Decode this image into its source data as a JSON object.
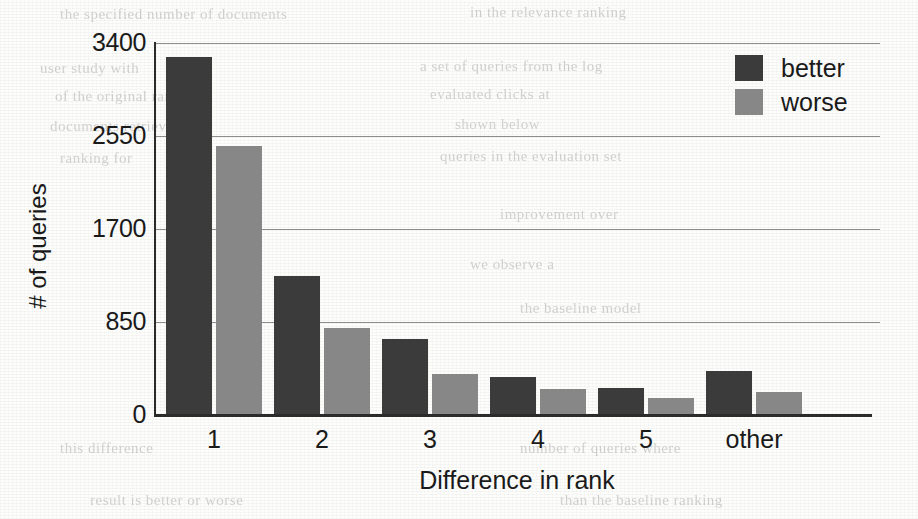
{
  "chart_data": {
    "type": "bar",
    "title": "",
    "xlabel": "Difference in rank",
    "ylabel": "# of queries",
    "categories": [
      "1",
      "2",
      "3",
      "4",
      "5",
      "other"
    ],
    "yticks": [
      0,
      850,
      1700,
      2550,
      3400
    ],
    "ylim": [
      0,
      3400
    ],
    "grid": true,
    "legend_position": "top-right",
    "series": [
      {
        "name": "better",
        "color": "#3b3b3b",
        "values": [
          3270,
          1270,
          695,
          345,
          245,
          400
        ]
      },
      {
        "name": "worse",
        "color": "#878787",
        "values": [
          2460,
          795,
          375,
          240,
          155,
          210
        ]
      }
    ]
  },
  "legend": {
    "items": [
      {
        "label": "better"
      },
      {
        "label": "worse"
      }
    ]
  },
  "scan_artifacts": {
    "ghost_lines": [
      {
        "text": "the specified number of documents",
        "x": 60,
        "y": 6
      },
      {
        "text": "in the relevance ranking",
        "x": 470,
        "y": 4
      },
      {
        "text": "user study with",
        "x": 40,
        "y": 60
      },
      {
        "text": "a set of queries from the log",
        "x": 420,
        "y": 58
      },
      {
        "text": "of the original ranking",
        "x": 55,
        "y": 88
      },
      {
        "text": "evaluated clicks at",
        "x": 430,
        "y": 86
      },
      {
        "text": "documents retrieved",
        "x": 50,
        "y": 118
      },
      {
        "text": "shown below",
        "x": 455,
        "y": 116
      },
      {
        "text": "ranking for",
        "x": 60,
        "y": 150
      },
      {
        "text": "queries in the evaluation set",
        "x": 440,
        "y": 148
      },
      {
        "text": "improvement over",
        "x": 500,
        "y": 206
      },
      {
        "text": "we observe a",
        "x": 470,
        "y": 256
      },
      {
        "text": "the baseline model",
        "x": 520,
        "y": 300
      },
      {
        "text": "this difference",
        "x": 60,
        "y": 440
      },
      {
        "text": "number of queries where",
        "x": 520,
        "y": 440
      },
      {
        "text": "result is better or worse",
        "x": 90,
        "y": 492
      },
      {
        "text": "than the baseline ranking",
        "x": 560,
        "y": 492
      }
    ]
  }
}
